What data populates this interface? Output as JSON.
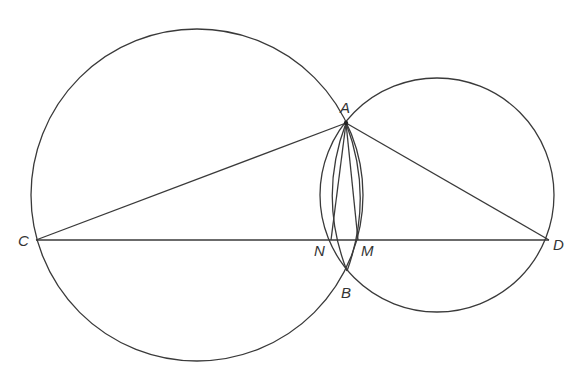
{
  "figure": {
    "type": "geometry-diagram",
    "stroke_color": "#3a3a3a",
    "label_color": "#333333",
    "circles": [
      {
        "name": "left-circle",
        "cx": 197,
        "cy": 195,
        "r": 166
      },
      {
        "name": "right-circle",
        "cx": 437,
        "cy": 195,
        "r": 117
      }
    ],
    "points": {
      "A": {
        "x": 346,
        "y": 123
      },
      "B": {
        "x": 347,
        "y": 271
      },
      "C": {
        "x": 36,
        "y": 240
      },
      "D": {
        "x": 549,
        "y": 240
      },
      "N": {
        "x": 331,
        "y": 240
      },
      "M": {
        "x": 358,
        "y": 240
      }
    },
    "segments": [
      [
        "C",
        "D"
      ],
      [
        "C",
        "A"
      ],
      [
        "A",
        "D"
      ],
      [
        "A",
        "N"
      ],
      [
        "A",
        "M"
      ]
    ],
    "arcs": [
      "A-N-B (arc of left circle through N)",
      "A-M-B (arc of right circle through M)"
    ],
    "labels": {
      "A": "A",
      "B": "B",
      "C": "C",
      "D": "D",
      "N": "N",
      "M": "M"
    }
  }
}
